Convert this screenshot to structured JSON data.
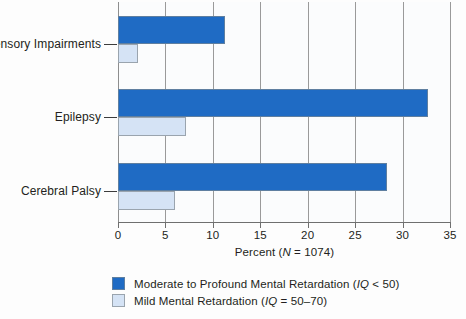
{
  "chart_data": {
    "type": "bar",
    "orientation": "horizontal",
    "title": "",
    "xlabel": "Percent (N = 1074)",
    "ylabel": "",
    "xlim": [
      0,
      35
    ],
    "xticks": [
      0,
      5,
      10,
      15,
      20,
      25,
      30,
      35
    ],
    "xtick_labels": [
      "0",
      "5",
      "10",
      "15",
      "20",
      "25",
      "30",
      "35"
    ],
    "grid": true,
    "legend_position": "below-left",
    "categories": [
      "Sensory Impairments",
      "Epilepsy",
      "Cerebral Palsy"
    ],
    "series": [
      {
        "name": "Moderate to Profound Mental Retardation (IQ < 50)",
        "color": "#1F6BC4",
        "values": [
          11.3,
          32.7,
          28.4
        ]
      },
      {
        "name": "Mild Mental Retardation (IQ = 50–70)",
        "color": "#D5E3F5",
        "values": [
          2.1,
          7.2,
          6.0
        ]
      }
    ]
  },
  "axis": {
    "x_title_prefix": "Percent (",
    "x_title_italic": "N",
    "x_title_suffix": " = 1074)"
  },
  "legend": {
    "items": [
      {
        "label_prefix": "Moderate to Profound Mental Retardation (",
        "label_italic": "IQ",
        "label_suffix": " < 50)",
        "color": "#1F6BC4"
      },
      {
        "label_prefix": "Mild Mental Retardation (",
        "label_italic": "IQ",
        "label_suffix": " = 50–70)",
        "color": "#D5E3F5"
      }
    ]
  }
}
